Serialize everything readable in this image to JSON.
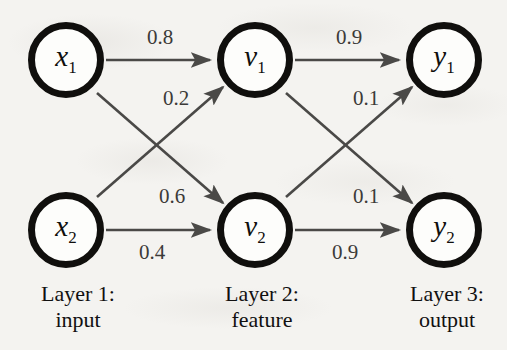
{
  "diagram": {
    "type": "neural-network",
    "background_color": "#f4f3f0",
    "node_color": "#100f0d",
    "edge_color": "#4a4947",
    "nodes": [
      {
        "id": "x1",
        "symbol": "x",
        "sub": "1",
        "layer": 1,
        "cx": 66,
        "cy": 60
      },
      {
        "id": "x2",
        "symbol": "x",
        "sub": "2",
        "layer": 1,
        "cx": 66,
        "cy": 230
      },
      {
        "id": "v1",
        "symbol": "v",
        "sub": "1",
        "layer": 2,
        "cx": 255,
        "cy": 60
      },
      {
        "id": "v2",
        "symbol": "v",
        "sub": "2",
        "layer": 2,
        "cx": 255,
        "cy": 230
      },
      {
        "id": "y1",
        "symbol": "y",
        "sub": "1",
        "layer": 3,
        "cx": 444,
        "cy": 60
      },
      {
        "id": "y2",
        "symbol": "y",
        "sub": "2",
        "layer": 3,
        "cx": 444,
        "cy": 230
      }
    ],
    "edges": [
      {
        "from": "x1",
        "to": "v1",
        "weight": "0.8",
        "lx": 160,
        "ly": 37
      },
      {
        "from": "x1",
        "to": "v2",
        "weight": "0.6",
        "lx": 172,
        "ly": 196
      },
      {
        "from": "x2",
        "to": "v1",
        "weight": "0.2",
        "lx": 176,
        "ly": 98
      },
      {
        "from": "x2",
        "to": "v2",
        "weight": "0.4",
        "lx": 152,
        "ly": 252
      },
      {
        "from": "v1",
        "to": "y1",
        "weight": "0.9",
        "lx": 349,
        "ly": 37
      },
      {
        "from": "v1",
        "to": "y2",
        "weight": "0.1",
        "lx": 366,
        "ly": 196
      },
      {
        "from": "v2",
        "to": "y1",
        "weight": "0.1",
        "lx": 366,
        "ly": 98
      },
      {
        "from": "v2",
        "to": "y2",
        "weight": "0.9",
        "lx": 345,
        "ly": 252
      }
    ],
    "captions": [
      {
        "id": "layer1",
        "line1": "Layer 1:",
        "line2": "input",
        "cx": 78,
        "top": 281
      },
      {
        "id": "layer2",
        "line1": "Layer 2:",
        "line2": "feature",
        "cx": 262,
        "top": 281
      },
      {
        "id": "layer3",
        "line1": "Layer 3:",
        "line2": "output",
        "cx": 447,
        "top": 281
      }
    ]
  }
}
